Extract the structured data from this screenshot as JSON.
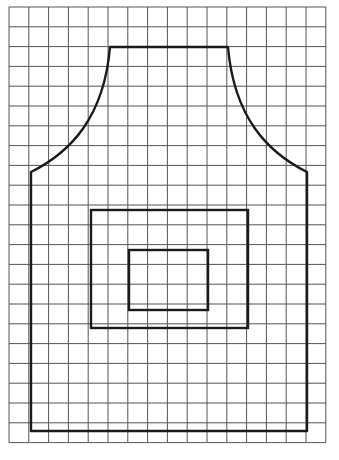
{
  "diagram": {
    "type": "apron-pattern-on-grid",
    "background": "#ffffff",
    "grid": {
      "left": 9,
      "top": 7,
      "cell": 19.8,
      "cols": 16,
      "rows": 22,
      "line_color": "#555555",
      "line_width": 1
    },
    "apron": {
      "stroke": "#1a1a1a",
      "stroke_width": 2.4,
      "neck_top_y": 47,
      "neck_left_x": 110,
      "neck_right_x": 228,
      "shoulder_left": [
        31,
        172
      ],
      "shoulder_right": [
        307,
        172
      ],
      "bottom_y": 431
    },
    "pocket_outer": {
      "x": 91,
      "y": 210,
      "w": 157,
      "h": 118
    },
    "pocket_inner": {
      "x": 129,
      "y": 250,
      "w": 79,
      "h": 60
    }
  }
}
